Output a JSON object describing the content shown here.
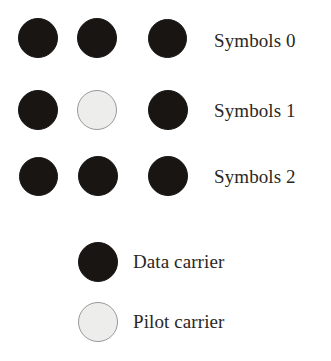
{
  "figure": {
    "background_color": "#ffffff",
    "data_carrier_color": "#181513",
    "pilot_carrier_color": "#edeeec",
    "pilot_carrier_border_color": "#96999a",
    "text_color": "#2a2724"
  },
  "grid": {
    "columns": 3,
    "rows": 3,
    "column_centers_px": [
      38,
      97,
      168
    ],
    "row_centers_px": [
      38,
      110,
      177
    ],
    "circle_diameter_px": 40,
    "rows_data": [
      {
        "label": "Symbols 0",
        "carriers": [
          "data",
          "data",
          "data"
        ]
      },
      {
        "label": "Symbols 1",
        "carriers": [
          "data",
          "pilot",
          "data"
        ]
      },
      {
        "label": "Symbols 2",
        "carriers": [
          "data",
          "data",
          "data"
        ]
      }
    ]
  },
  "legend": {
    "items": [
      {
        "label": "Data carrier",
        "type": "data",
        "center_px": [
          97,
          262
        ]
      },
      {
        "label": "Pilot carrier",
        "type": "pilot",
        "center_px": [
          97,
          322
        ]
      }
    ]
  }
}
